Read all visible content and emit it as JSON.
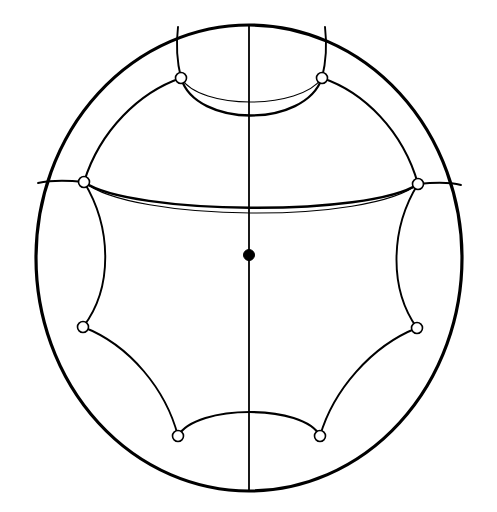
{
  "figure": {
    "background_color": "#ffffff",
    "stroke_color": "#000000",
    "vertex_fill_color": "#ffffff",
    "center_point_fill_color": "#000000",
    "canvas": {
      "width": 497,
      "height": 512
    }
  },
  "chart_data": {
    "type": "scatter",
    "xlabel": "",
    "ylabel": "",
    "xlim": [
      36,
      462
    ],
    "ylim": [
      25,
      492
    ],
    "grid": false,
    "legend_position": "none",
    "boundary_circle": {
      "label": "ideal-boundary",
      "cx": 249,
      "cy": 258,
      "rx": 213,
      "ry": 233,
      "stroke_width": 3.2
    },
    "center_point": {
      "label": "center-basepoint",
      "x": 249,
      "y": 255,
      "radius": 5.5,
      "fill": "#000000"
    },
    "vertices": [
      {
        "label": "vertex-top-left",
        "x": 181,
        "y": 78,
        "radius": 5.5
      },
      {
        "label": "vertex-top-right",
        "x": 322,
        "y": 78,
        "radius": 5.5
      },
      {
        "label": "vertex-mid-left",
        "x": 84,
        "y": 182,
        "radius": 5.5
      },
      {
        "label": "vertex-mid-right",
        "x": 418,
        "y": 184,
        "radius": 5.5
      },
      {
        "label": "vertex-low-left",
        "x": 83,
        "y": 327,
        "radius": 5.5
      },
      {
        "label": "vertex-low-right",
        "x": 417,
        "y": 328,
        "radius": 5.5
      },
      {
        "label": "vertex-bottom-left",
        "x": 178,
        "y": 436,
        "radius": 5.5
      },
      {
        "label": "vertex-bottom-right",
        "x": 320,
        "y": 436,
        "radius": 5.5
      }
    ],
    "axis_line": {
      "label": "vertical-axis",
      "x1": 249,
      "y1": 25,
      "x2": 249,
      "y2": 492,
      "stroke_width": 1.8
    },
    "geodesics": [
      {
        "label": "radial-top-left-to-boundary",
        "path": "M 181 78 C 176 58 176 44 178 27",
        "stroke_width": 1.9
      },
      {
        "label": "radial-top-right-to-boundary",
        "path": "M 322 78 C 327 58 327 44 325 27",
        "stroke_width": 1.9
      },
      {
        "label": "radial-mid-left-to-boundary",
        "path": "M 84 182 C 64 180 52 180 38 183",
        "stroke_width": 1.9
      },
      {
        "label": "radial-mid-right-to-boundary",
        "path": "M 418 184 C 437 182 450 182 461 185",
        "stroke_width": 1.9
      },
      {
        "label": "arc-thin-top-pair",
        "path": "M 181 78 C 200 110 300 110 322 78",
        "stroke_width": 1.1
      },
      {
        "label": "arc-thick-top-pair",
        "path": "M 181 78 C 196 128 305 128 322 78",
        "stroke_width": 2.3
      },
      {
        "label": "arc-top-left-to-mid-left",
        "path": "M 181 78 C 140 92 100 130 84 182",
        "stroke_width": 2.1
      },
      {
        "label": "arc-top-right-to-mid-right",
        "path": "M 322 78 C 364 92 403 131 418 184",
        "stroke_width": 2.1
      },
      {
        "label": "arc-thick-mid-pair",
        "path": "M 84 182 C 130 215 370 217 418 184",
        "stroke_width": 2.3
      },
      {
        "label": "arc-thin-mid-pair",
        "path": "M 84 182 C 132 222 369 224 418 184",
        "stroke_width": 1.1
      },
      {
        "label": "arc-mid-left-to-low-left",
        "path": "M 84 182 C 112 228 113 288 83 327",
        "stroke_width": 1.9
      },
      {
        "label": "arc-mid-right-to-low-right",
        "path": "M 418 184 C 390 229 389 289 417 328",
        "stroke_width": 1.9
      },
      {
        "label": "arc-low-left-to-bottom-left",
        "path": "M 83 327 C 130 345 166 390 178 436",
        "stroke_width": 1.9
      },
      {
        "label": "arc-low-right-to-bottom-right",
        "path": "M 417 328 C 371 346 333 391 320 436",
        "stroke_width": 1.9
      },
      {
        "label": "arc-bottom-pair",
        "path": "M 178 436 C 196 404 304 404 320 436",
        "stroke_width": 2.2
      }
    ]
  }
}
